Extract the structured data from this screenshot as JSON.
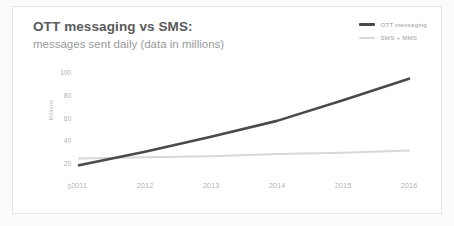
{
  "card": {
    "title": "OTT messaging vs SMS:",
    "subtitle": "messages sent daily (data in millions)"
  },
  "legend": {
    "position": "top-right",
    "items": [
      {
        "label": "OTT messaging",
        "color": "#4a4a4a"
      },
      {
        "label": "SMS + MMS",
        "color": "#d8d8d8"
      }
    ]
  },
  "chart_data": {
    "type": "line",
    "title": "OTT messaging vs SMS:",
    "subtitle": "messages sent daily (data in millions)",
    "xlabel": "",
    "ylabel": "Millions",
    "x": [
      2011,
      2012,
      2013,
      2014,
      2015,
      2016
    ],
    "categories": [
      "2011",
      "2012",
      "2013",
      "2014",
      "2015",
      "2016"
    ],
    "series": [
      {
        "name": "OTT messaging",
        "color": "#4a4a4a",
        "values": [
          19,
          31,
          44,
          58,
          76,
          95
        ]
      },
      {
        "name": "SMS + MMS",
        "color": "#d8d8d8",
        "values": [
          25,
          26,
          27,
          29,
          30,
          32
        ]
      }
    ],
    "ylim": [
      0,
      100
    ],
    "xlim": [
      2011,
      2016
    ],
    "yticks": [
      0,
      20,
      40,
      60,
      80,
      100
    ],
    "ytick_labels": [
      "0",
      "20",
      "40",
      "60",
      "80",
      "100"
    ],
    "grid": false,
    "legend_position": "top-right"
  }
}
